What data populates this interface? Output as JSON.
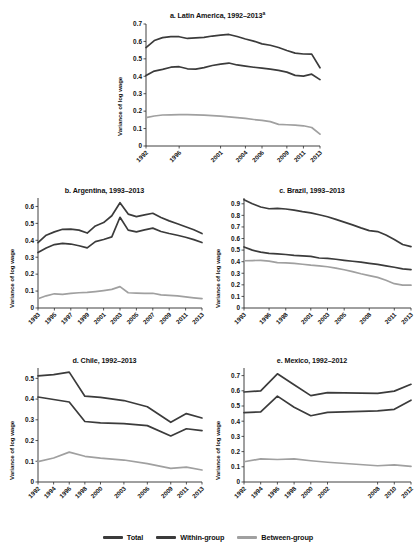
{
  "figure": {
    "background": "#ffffff",
    "ylabel": "Variance of log wage"
  },
  "legend": {
    "items": [
      {
        "label": "Total",
        "color": "#3b3b3b"
      },
      {
        "label": "Within-group",
        "color": "#3b3b3b"
      },
      {
        "label": "Between-group",
        "color": "#a0a0a0"
      }
    ]
  },
  "colors": {
    "total": "#3b3b3b",
    "within": "#3b3b3b",
    "between": "#a0a0a0",
    "axis": "#2b2b2b"
  },
  "panels": [
    {
      "key": "a",
      "title_prefix": "a. Latin America, 1992–2013",
      "title_superscript": "a"
    },
    {
      "key": "b",
      "title_prefix": "b. Argentina, 1993–2013",
      "title_superscript": ""
    },
    {
      "key": "c",
      "title_prefix": "c. Brazil, 1993–2013",
      "title_superscript": ""
    },
    {
      "key": "d",
      "title_prefix": "d. Chile, 1992–2013",
      "title_superscript": ""
    },
    {
      "key": "e",
      "title_prefix": "e. Mexico, 1992–2012",
      "title_superscript": ""
    }
  ],
  "chart_data": [
    {
      "id": "a",
      "type": "line",
      "title": "a. Latin America, 1992–2013a",
      "xlabel": "",
      "ylabel": "Variance of log wage",
      "ylim": [
        0,
        0.7
      ],
      "yticks": [
        0,
        0.1,
        0.2,
        0.3,
        0.4,
        0.5,
        0.6,
        0.7
      ],
      "ytick_labels": [
        "0",
        "0.1",
        "0.2",
        "0.3",
        "0.4",
        "0.5",
        "0.6",
        "0.7"
      ],
      "xticks": [
        1992,
        1996,
        2001,
        2004,
        2006,
        2009,
        2011,
        2013
      ],
      "xtick_labels": [
        "1992",
        "1996",
        "2001",
        "2004",
        "2006",
        "2009",
        "2011",
        "2013"
      ],
      "xlim": [
        1992,
        2013
      ],
      "grid": false,
      "legend_position": "bottom",
      "x": [
        1992,
        1993,
        1994,
        1995,
        1996,
        1997,
        1998,
        1999,
        2000,
        2001,
        2002,
        2003,
        2004,
        2005,
        2006,
        2007,
        2008,
        2009,
        2010,
        2011,
        2012,
        2013
      ],
      "series": [
        {
          "name": "Total",
          "color": "#3b3b3b",
          "values": [
            0.565,
            0.605,
            0.622,
            0.628,
            0.627,
            0.617,
            0.62,
            0.623,
            0.631,
            0.636,
            0.64,
            0.628,
            0.614,
            0.602,
            0.586,
            0.578,
            0.565,
            0.548,
            0.533,
            0.528,
            0.527,
            0.449
          ]
        },
        {
          "name": "Within-group",
          "color": "#3b3b3b",
          "values": [
            0.404,
            0.43,
            0.44,
            0.452,
            0.455,
            0.443,
            0.441,
            0.45,
            0.462,
            0.47,
            0.476,
            0.465,
            0.458,
            0.452,
            0.447,
            0.441,
            0.434,
            0.424,
            0.405,
            0.401,
            0.412,
            0.381
          ]
        },
        {
          "name": "Between-group",
          "color": "#a0a0a0",
          "values": [
            0.163,
            0.172,
            0.178,
            0.179,
            0.18,
            0.18,
            0.179,
            0.177,
            0.174,
            0.171,
            0.167,
            0.163,
            0.158,
            0.152,
            0.147,
            0.14,
            0.124,
            0.122,
            0.12,
            0.116,
            0.106,
            0.068
          ]
        }
      ]
    },
    {
      "id": "b",
      "type": "line",
      "title": "b. Argentina, 1993–2013",
      "xlabel": "",
      "ylabel": "Variance of log wage",
      "ylim": [
        0,
        0.65
      ],
      "yticks": [
        0,
        0.1,
        0.2,
        0.3,
        0.4,
        0.5,
        0.6
      ],
      "ytick_labels": [
        "0",
        "0.1",
        "0.2",
        "0.3",
        "0.4",
        "0.5",
        "0.6"
      ],
      "xticks": [
        1993,
        1995,
        1997,
        1999,
        2001,
        2003,
        2005,
        2007,
        2009,
        2011,
        2013
      ],
      "xtick_labels": [
        "1993",
        "1995",
        "1997",
        "1999",
        "2001",
        "2003",
        "2005",
        "2007",
        "2009",
        "2011",
        "2013"
      ],
      "xlim": [
        1993,
        2013
      ],
      "grid": false,
      "legend_position": "bottom",
      "x": [
        1993,
        1994,
        1995,
        1996,
        1997,
        1998,
        1999,
        2000,
        2001,
        2002,
        2003,
        2004,
        2005,
        2006,
        2007,
        2008,
        2009,
        2010,
        2011,
        2012,
        2013
      ],
      "series": [
        {
          "name": "Total",
          "color": "#3b3b3b",
          "values": [
            0.386,
            0.43,
            0.45,
            0.465,
            0.466,
            0.46,
            0.443,
            0.485,
            0.505,
            0.545,
            0.622,
            0.555,
            0.54,
            0.55,
            0.56,
            0.535,
            0.515,
            0.498,
            0.48,
            0.462,
            0.44
          ]
        },
        {
          "name": "Within-group",
          "color": "#3b3b3b",
          "values": [
            0.328,
            0.355,
            0.375,
            0.382,
            0.378,
            0.368,
            0.355,
            0.392,
            0.405,
            0.42,
            0.536,
            0.46,
            0.45,
            0.462,
            0.472,
            0.452,
            0.44,
            0.43,
            0.418,
            0.404,
            0.387
          ]
        },
        {
          "name": "Between-group",
          "color": "#a0a0a0",
          "values": [
            0.055,
            0.072,
            0.084,
            0.081,
            0.086,
            0.09,
            0.092,
            0.097,
            0.103,
            0.11,
            0.126,
            0.09,
            0.088,
            0.086,
            0.087,
            0.078,
            0.075,
            0.072,
            0.066,
            0.06,
            0.055
          ]
        }
      ]
    },
    {
      "id": "c",
      "type": "line",
      "title": "c. Brazil, 1993–2013",
      "xlabel": "",
      "ylabel": "Variance of log wage",
      "ylim": [
        0,
        0.95
      ],
      "yticks": [
        0,
        0.1,
        0.2,
        0.3,
        0.4,
        0.5,
        0.6,
        0.7,
        0.8,
        0.9
      ],
      "ytick_labels": [
        "0",
        "0.1",
        "0.2",
        "0.3",
        "0.4",
        "0.5",
        "0.6",
        "0.7",
        "0.8",
        "0.9"
      ],
      "xticks": [
        1993,
        1996,
        1998,
        2001,
        2003,
        2005,
        2008,
        2011,
        2013
      ],
      "xtick_labels": [
        "1993",
        "1996",
        "1998",
        "2001",
        "2003",
        "2005",
        "2008",
        "2011",
        "2013"
      ],
      "xlim": [
        1993,
        2013
      ],
      "grid": false,
      "legend_position": "bottom",
      "x": [
        1993,
        1994,
        1995,
        1996,
        1997,
        1998,
        1999,
        2000,
        2001,
        2002,
        2003,
        2004,
        2005,
        2006,
        2007,
        2008,
        2009,
        2010,
        2011,
        2012,
        2013
      ],
      "series": [
        {
          "name": "Total",
          "color": "#3b3b3b",
          "values": [
            0.935,
            0.9,
            0.872,
            0.857,
            0.86,
            0.855,
            0.845,
            0.832,
            0.822,
            0.805,
            0.788,
            0.765,
            0.742,
            0.718,
            0.692,
            0.668,
            0.66,
            0.63,
            0.592,
            0.548,
            0.53
          ]
        },
        {
          "name": "Within-group",
          "color": "#3b3b3b",
          "values": [
            0.527,
            0.5,
            0.482,
            0.472,
            0.468,
            0.462,
            0.455,
            0.45,
            0.446,
            0.432,
            0.428,
            0.421,
            0.412,
            0.404,
            0.396,
            0.386,
            0.376,
            0.364,
            0.352,
            0.338,
            0.332
          ]
        },
        {
          "name": "Between-group",
          "color": "#a0a0a0",
          "values": [
            0.408,
            0.41,
            0.412,
            0.405,
            0.392,
            0.39,
            0.385,
            0.378,
            0.37,
            0.364,
            0.356,
            0.344,
            0.33,
            0.314,
            0.296,
            0.28,
            0.264,
            0.24,
            0.21,
            0.198,
            0.197
          ]
        }
      ]
    },
    {
      "id": "d",
      "type": "line",
      "title": "d. Chile, 1992–2013",
      "xlabel": "",
      "ylabel": "Variance of log wage",
      "ylim": [
        0,
        0.55
      ],
      "yticks": [
        0,
        0.1,
        0.2,
        0.3,
        0.4,
        0.5
      ],
      "ytick_labels": [
        "0",
        "0.1",
        "0.2",
        "0.3",
        "0.4",
        "0.5"
      ],
      "xticks": [
        1992,
        1994,
        1996,
        1998,
        2000,
        2003,
        2006,
        2009,
        2011,
        2013
      ],
      "xtick_labels": [
        "1992",
        "1994",
        "1996",
        "1998",
        "2000",
        "2003",
        "2006",
        "2009",
        "2011",
        "2013"
      ],
      "xlim": [
        1992,
        2013
      ],
      "grid": false,
      "legend_position": "bottom",
      "x": [
        1992,
        1994,
        1996,
        1998,
        2000,
        2003,
        2006,
        2009,
        2011,
        2013
      ],
      "series": [
        {
          "name": "Total",
          "color": "#3b3b3b",
          "values": [
            0.512,
            0.518,
            0.53,
            0.414,
            0.408,
            0.393,
            0.363,
            0.288,
            0.33,
            0.309
          ]
        },
        {
          "name": "Within-group",
          "color": "#3b3b3b",
          "values": [
            0.41,
            0.398,
            0.386,
            0.292,
            0.285,
            0.282,
            0.272,
            0.222,
            0.257,
            0.248
          ]
        },
        {
          "name": "Between-group",
          "color": "#a0a0a0",
          "values": [
            0.098,
            0.116,
            0.144,
            0.124,
            0.115,
            0.106,
            0.089,
            0.066,
            0.072,
            0.058
          ]
        }
      ]
    },
    {
      "id": "e",
      "type": "line",
      "title": "e. Mexico, 1992–2012",
      "xlabel": "",
      "ylabel": "Variance of log wage",
      "ylim": [
        0,
        0.75
      ],
      "yticks": [
        0,
        0.1,
        0.2,
        0.3,
        0.4,
        0.5,
        0.6,
        0.7
      ],
      "ytick_labels": [
        "0",
        "0.1",
        "0.2",
        "0.3",
        "0.4",
        "0.5",
        "0.6",
        "0.7"
      ],
      "xticks": [
        1992,
        1994,
        1996,
        1998,
        2000,
        2002,
        2008,
        2010,
        2012
      ],
      "xtick_labels": [
        "1992",
        "1994",
        "1996",
        "1998",
        "2000",
        "2002",
        "2008",
        "2010",
        "2012"
      ],
      "xlim": [
        1992,
        2012
      ],
      "grid": false,
      "legend_position": "bottom",
      "x": [
        1992,
        1994,
        1996,
        1998,
        2000,
        2002,
        2008,
        2010,
        2012
      ],
      "series": [
        {
          "name": "Total",
          "color": "#3b3b3b",
          "values": [
            0.592,
            0.6,
            0.712,
            0.64,
            0.568,
            0.588,
            0.583,
            0.598,
            0.643
          ]
        },
        {
          "name": "Within-group",
          "color": "#3b3b3b",
          "values": [
            0.456,
            0.462,
            0.565,
            0.492,
            0.436,
            0.458,
            0.468,
            0.478,
            0.538
          ]
        },
        {
          "name": "Between-group",
          "color": "#a0a0a0",
          "values": [
            0.133,
            0.152,
            0.148,
            0.152,
            0.14,
            0.13,
            0.107,
            0.113,
            0.103
          ]
        }
      ]
    }
  ]
}
